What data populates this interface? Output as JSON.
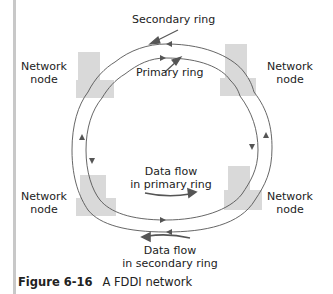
{
  "labels": {
    "secondary_ring": "Secondary ring",
    "primary_ring": "Primary ring",
    "node_top_left": [
      "Network",
      "node"
    ],
    "node_top_right": [
      "Network",
      "node"
    ],
    "node_bottom_left": [
      "Network",
      "node"
    ],
    "node_bottom_right": [
      "Network",
      "node"
    ],
    "flow_primary": [
      "Data flow",
      "in primary ring"
    ],
    "flow_secondary": [
      "Data flow",
      "in secondary ring"
    ]
  },
  "caption": {
    "figure_number": "Figure 6-16",
    "title": "A FDDI network"
  },
  "colors": {
    "ring_line": "#555555",
    "node_fill": "#d9d9d9",
    "arrow": "#555555",
    "left_bar": "#c8c8c8"
  }
}
